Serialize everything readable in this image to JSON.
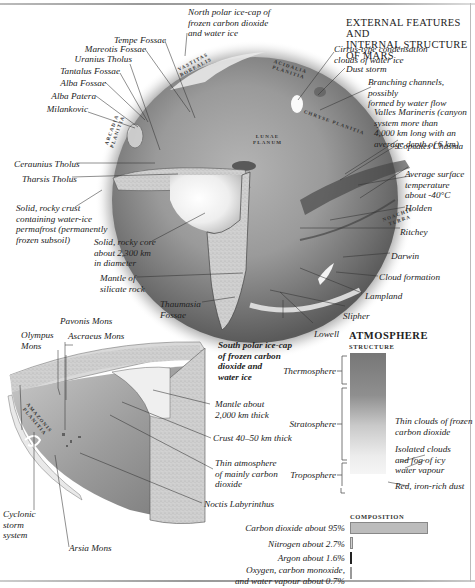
{
  "title": "EXTERNAL FEATURES AND\nINTERNAL STRUCTURE OF MARS",
  "globe_labels": {
    "north_polar_cap": "North polar ice-cap of\nfrozen carbon dioxide\nand water ice",
    "tempe_fossae": "Tempe Fossae",
    "mareotis_fossae": "Mareotis Fossae",
    "uranius_tholus": "Uranius Tholus",
    "tantalus_fossae": "Tantalus Fossae",
    "alba_fossae": "Alba Fossae",
    "alba_patera": "Alba Patera",
    "milankovic": "Milankovic",
    "ceraunius_tholus": "Ceraunius Tholus",
    "tharsis_tholus": "Tharsis Tholus",
    "rocky_crust": "Solid, rocky crust\ncontaining water-ice\npermafrost (permanently\nfrozen subsoil)",
    "rocky_core": "Solid, rocky core\nabout 2,300 km\nin diameter",
    "mantle_silicate": "Mantle of\nsilicate rock",
    "thaumasia_fossae": "Thaumasia\nFossae",
    "cirrus_clouds": "Cirrus-type condensation\nclouds of water ice",
    "dust_storm": "Dust storm",
    "branching_channels": "Branching channels, possibly\nformed by water flow",
    "valles_marineris": "Valles Marineris (canyon\nsystem more than\n4,000 km long with an\naverage depth of 6 km)",
    "coprates_chasma": "Coprates Chasma",
    "avg_temperature": "Average surface\ntemperature\nabout -40°C",
    "holden": "Holden",
    "ritchey": "Ritchey",
    "darwin": "Darwin",
    "cloud_formation": "Cloud formation",
    "lampland": "Lampland",
    "slipher": "Slipher",
    "lowell": "Lowell",
    "south_polar_cap": "South polar ice-cap\nof frozen carbon\ndioxide and\nwater ice"
  },
  "map_regions": {
    "vastitas_borealis": "VASTITAS\nBOREALIS",
    "acidalia_planitia": "ACIDALIA\nPLANITIA",
    "arcadia_planitia": "ARCADIA\nPLANITIA",
    "lunae_planum": "LUNAE\nPLANUM",
    "chryse_planitia": "CHRYSE PLANITIA",
    "amazonis_planitia": "AMAZONIS\nPLANITIA",
    "noachis_terra": "NOACHIS\nTERRA"
  },
  "section_labels": {
    "pavonis_mons": "Pavonis Mons",
    "olympus_mons": "Olympus\nMons",
    "ascraeus_mons": "Ascraeus Mons",
    "mantle_thickness": "Mantle about\n2,000 km thick",
    "crust_thickness": "Crust 40–50 km thick",
    "thin_atmosphere": "Thin atmosphere\nof mainly carbon\ndioxide",
    "noctis_labyrinthus": "Noctis Labyrinthus",
    "cyclonic_storm": "Cyclonic\nstorm\nsystem",
    "arsia_mons": "Arsia Mons"
  },
  "atmosphere": {
    "heading": "ATMOSPHERE",
    "structure_heading": "STRUCTURE",
    "layers": [
      {
        "name": "Thermosphere"
      },
      {
        "name": "Stratosphere"
      },
      {
        "name": "Troposphere"
      }
    ],
    "annotations": [
      "Thin clouds of frozen\ncarbon dioxide",
      "Isolated clouds\nand fog of icy\nwater vapour",
      "Red, iron-rich dust"
    ],
    "composition_heading": "COMPOSITION",
    "composition": [
      {
        "label": "Carbon dioxide about 95%",
        "percent": 95,
        "color": "#b8b8b8"
      },
      {
        "label": "Nitrogen about 2.7%",
        "percent": 2.7,
        "color": "#d0d0d0"
      },
      {
        "label": "Argon about 1.6%",
        "percent": 1.6,
        "color": "#222222"
      },
      {
        "label": "Oxygen, carbon monoxide,\nand water vapour about 0.7%",
        "percent": 0.7,
        "color": "#e0e0e0"
      }
    ]
  }
}
